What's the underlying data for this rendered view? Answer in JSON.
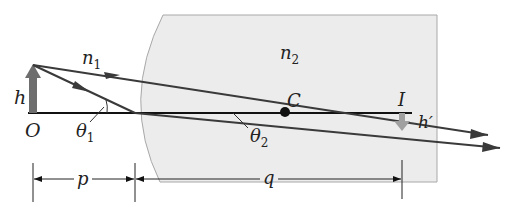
{
  "diagram": {
    "labels": {
      "n1": "n",
      "n1_sub": "1",
      "n2": "n",
      "n2_sub": "2",
      "h": "h",
      "O": "O",
      "theta1": "θ",
      "theta1_sub": "1",
      "theta2": "θ",
      "theta2_sub": "2",
      "C": "C",
      "I": "I",
      "h_prime": "h′",
      "p": "p",
      "q": "q"
    },
    "colors": {
      "medium2_fill": "#ececec",
      "medium2_border": "#a8a8a8",
      "ray": "#3a3a3a",
      "object_arrow": "#6e6e6e",
      "image_arrow": "#a0a0a0",
      "axis": "#111111"
    }
  }
}
